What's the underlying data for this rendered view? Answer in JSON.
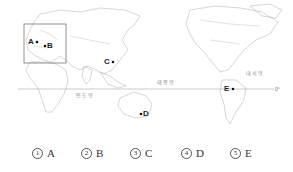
{
  "map": {
    "points": [
      {
        "label": "A",
        "x": 29,
        "y": 38
      },
      {
        "label": "B",
        "x": 47,
        "y": 42
      },
      {
        "label": "C",
        "x": 104,
        "y": 58
      },
      {
        "label": "D",
        "x": 144,
        "y": 110
      },
      {
        "label": "E",
        "x": 224,
        "y": 85
      }
    ],
    "oceans": {
      "indian": "인도양",
      "pacific": "태평양",
      "atlantic": "대서양"
    },
    "equator_label": "0°"
  },
  "choices": [
    {
      "num": "1",
      "label": "A"
    },
    {
      "num": "2",
      "label": "B"
    },
    {
      "num": "3",
      "label": "C"
    },
    {
      "num": "4",
      "label": "D"
    },
    {
      "num": "5",
      "label": "E"
    }
  ]
}
